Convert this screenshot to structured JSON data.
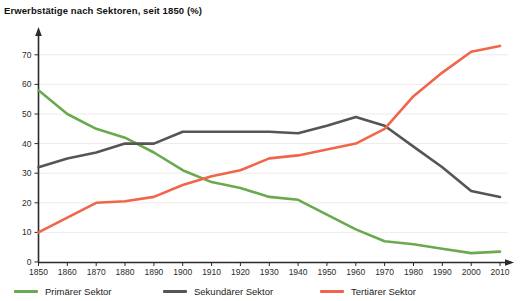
{
  "chart_data": {
    "type": "line",
    "title": "Erwerbstätige nach Sektoren, seit 1850 (%)",
    "xlabel": "",
    "ylabel": "",
    "xlim": [
      1850,
      2010
    ],
    "ylim": [
      0,
      75
    ],
    "grid": true,
    "legend_position": "bottom",
    "x": [
      1850,
      1860,
      1870,
      1880,
      1890,
      1900,
      1910,
      1920,
      1930,
      1940,
      1950,
      1960,
      1970,
      1980,
      1990,
      2000,
      2010
    ],
    "xticks": [
      "1850",
      "1860",
      "1870",
      "1880",
      "1890",
      "1900",
      "1910",
      "1920",
      "1930",
      "1940",
      "1950",
      "1960",
      "1970",
      "1980",
      "1990",
      "2000",
      "2010"
    ],
    "yticks": [
      "0",
      "10",
      "20",
      "30",
      "40",
      "50",
      "60",
      "70"
    ],
    "series": [
      {
        "name": "Primärer Sektor",
        "color": "#6aaa4f",
        "values": [
          58,
          50,
          45,
          42,
          37,
          31,
          27,
          25,
          22,
          21,
          16,
          11,
          7,
          6,
          4.5,
          3,
          3.5
        ]
      },
      {
        "name": "Sekundärer Sektor",
        "color": "#555555",
        "values": [
          32,
          35,
          37,
          40,
          40,
          44,
          44,
          44,
          44,
          43.5,
          46,
          49,
          46,
          39,
          32,
          24,
          22
        ]
      },
      {
        "name": "Tertiärer Sektor",
        "color": "#f1664b",
        "values": [
          10,
          15,
          20,
          20.5,
          22,
          26,
          29,
          31,
          35,
          36,
          38,
          40,
          45,
          56,
          64,
          71,
          73
        ]
      }
    ]
  },
  "legend": {
    "items": [
      {
        "label": "Primärer Sektor"
      },
      {
        "label": "Sekundärer Sektor"
      },
      {
        "label": "Tertiärer Sektor"
      }
    ]
  }
}
